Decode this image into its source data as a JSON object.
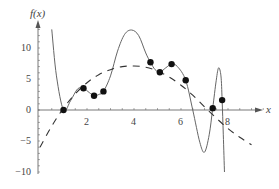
{
  "chart_data": {
    "type": "line",
    "title": "",
    "xlabel": "x",
    "ylabel": "f(x)",
    "xlim": [
      0,
      9.5
    ],
    "ylim": [
      -10,
      14
    ],
    "x_ticks": [
      2,
      4,
      6,
      8
    ],
    "y_ticks": [
      -10,
      -5,
      0,
      5,
      10
    ],
    "grid": false,
    "legend": null,
    "series": [
      {
        "name": "data points",
        "style": "scatter",
        "x": [
          1.0,
          1.85,
          2.3,
          2.7,
          4.7,
          5.1,
          5.6,
          6.2,
          7.35,
          7.75
        ],
        "y": [
          0.0,
          3.5,
          2.3,
          3.0,
          7.7,
          6.1,
          7.4,
          4.8,
          0.3,
          1.6
        ]
      },
      {
        "name": "interpolating polynomial",
        "style": "solid",
        "x": [
          0.5,
          0.7,
          1.0,
          1.3,
          1.6,
          1.85,
          2.1,
          2.3,
          2.5,
          2.7,
          3.0,
          3.3,
          3.6,
          3.9,
          4.2,
          4.5,
          4.7,
          4.9,
          5.1,
          5.35,
          5.6,
          5.85,
          6.2,
          6.5,
          6.8,
          7.0,
          7.2,
          7.35,
          7.5,
          7.6,
          7.7,
          7.75,
          7.8,
          7.85
        ],
        "y": [
          13.0,
          5.5,
          0.0,
          1.5,
          3.4,
          3.5,
          2.8,
          2.3,
          2.5,
          3.0,
          5.5,
          9.5,
          12.2,
          12.9,
          12.0,
          9.2,
          7.7,
          6.5,
          6.1,
          6.8,
          7.4,
          7.0,
          4.8,
          0.0,
          -5.2,
          -6.8,
          -4.0,
          0.3,
          4.8,
          6.8,
          5.5,
          1.6,
          -4.0,
          -10.0
        ]
      },
      {
        "name": "least-squares fit",
        "style": "dashed",
        "x": [
          0.0,
          0.5,
          1.0,
          1.5,
          2.0,
          2.5,
          3.0,
          3.5,
          4.0,
          4.5,
          5.0,
          5.5,
          6.0,
          6.5,
          7.0,
          7.5,
          8.0,
          8.5,
          9.0
        ],
        "y": [
          -6.0,
          -2.6,
          0.3,
          2.6,
          4.4,
          5.7,
          6.5,
          7.0,
          7.1,
          6.9,
          6.3,
          5.3,
          4.0,
          2.4,
          0.5,
          -1.3,
          -3.0,
          -4.4,
          -5.6
        ]
      }
    ]
  },
  "axes": {
    "y_label": "f(x)",
    "x_label": "x",
    "x_tick_labels": [
      "2",
      "4",
      "6",
      "8"
    ],
    "y_tick_labels": [
      "10",
      "5",
      "0",
      "−5",
      "−10"
    ]
  },
  "colors": {
    "axis": "#555555",
    "curve": "#666666",
    "dashed": "#333333",
    "point": "#111111"
  }
}
